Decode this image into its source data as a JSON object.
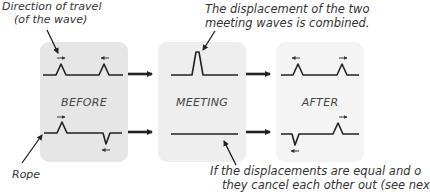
{
  "annotations": {
    "direction_line1": "Direction of travel",
    "direction_line2": "(of the wave)",
    "combined_line1": "The displacement of the two",
    "combined_line2": "meeting waves is combined.",
    "rope": "Rope",
    "cancel_line1": "If the displacements are equal and o",
    "cancel_line2": "they cancel each other out (see nex"
  },
  "panels": [
    {
      "title": "BEFORE",
      "bg": "#e6e6e6"
    },
    {
      "title": "MEETING",
      "bg": "#eeeeee"
    },
    {
      "title": "AFTER",
      "bg": "#f3f3f3"
    }
  ]
}
